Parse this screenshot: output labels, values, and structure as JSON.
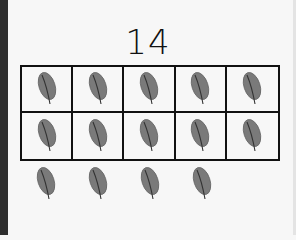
{
  "number": "14",
  "ten_frame": {
    "filled": 10,
    "total": 10,
    "item": "leaf-icon"
  },
  "extra_items": {
    "count": 4,
    "item": "leaf-icon"
  },
  "colors": {
    "leaf": "#7a7a7a",
    "vein": "#333333",
    "grid": "#111111"
  }
}
